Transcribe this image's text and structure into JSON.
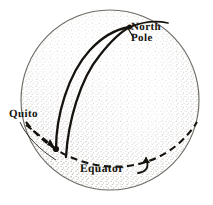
{
  "figure": {
    "background_color": "#ffffff",
    "ink_color": "#16130f",
    "outline_color": "#7d7a74",
    "stipple_color": "#b9b5ad"
  },
  "labels": {
    "north_pole": {
      "line1": "North",
      "line2": "Pole"
    },
    "quito": "Quito",
    "equator": "Equator"
  },
  "geometry": {
    "sphere": {
      "center_x": 110,
      "center_y": 100,
      "radius_x": 89,
      "radius_y": 90
    },
    "north_pole_point": {
      "x": 129,
      "y": 28
    },
    "quito_point": {
      "x": 56,
      "y": 149
    },
    "equator": {
      "left_x": 33,
      "right_x": 198,
      "y": 150,
      "style": "dashed"
    },
    "meridians": [
      {
        "name": "meridian-west",
        "from": "quito_point",
        "to": "north_pole_point"
      },
      {
        "name": "meridian-east",
        "from": "equator",
        "to": "north_pole_point"
      }
    ]
  }
}
